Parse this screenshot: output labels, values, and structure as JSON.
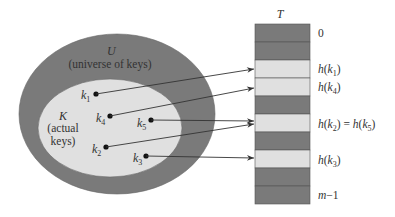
{
  "colors": {
    "dark": "#7a7a7a",
    "light": "#e0e0e0",
    "line": "#333333",
    "text": "#333333"
  },
  "universe": {
    "symbol": "U",
    "caption": "(universe of keys)"
  },
  "actual": {
    "symbol": "K",
    "caption_line1": "(actual",
    "caption_line2": "keys)"
  },
  "keys": [
    {
      "name": "k",
      "sub": "1"
    },
    {
      "name": "k",
      "sub": "4"
    },
    {
      "name": "k",
      "sub": "5"
    },
    {
      "name": "k",
      "sub": "2"
    },
    {
      "name": "k",
      "sub": "3"
    }
  ],
  "table": {
    "title": "T",
    "slots": 10,
    "light_slots": [
      2,
      3,
      5,
      7
    ],
    "labels": {
      "slot0": "0",
      "slot2": "h(k1)",
      "slot3": "h(k4)",
      "slot5": "h(k2) = h(k5)",
      "slot7": "h(k3)",
      "slot9": "m−1"
    },
    "label_parts": {
      "h": "h",
      "k": "k",
      "eq": " = ",
      "m": "m",
      "minus1": "−1",
      "zero": "0"
    }
  }
}
